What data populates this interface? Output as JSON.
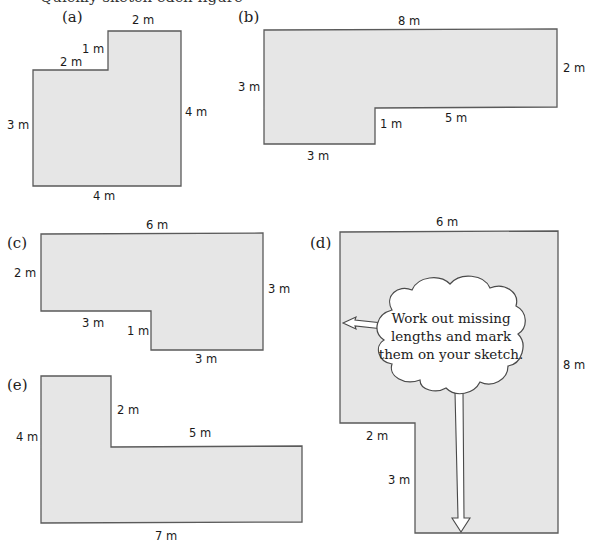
{
  "header": {
    "cut_off_text": "Quickly sketch each figure"
  },
  "colors": {
    "shape_fill": "#e6e6e6",
    "shape_stroke": "#5a5a5a",
    "cloud_fill": "#ffffff"
  },
  "shapes": [
    {
      "label": "(a)",
      "dims": [
        "2 m",
        "1 m",
        "2 m",
        "3 m",
        "4 m",
        "4 m"
      ]
    },
    {
      "label": "(b)",
      "dims": [
        "8 m",
        "3 m",
        "2 m",
        "1 m",
        "5 m",
        "3 m"
      ]
    },
    {
      "label": "(c)",
      "dims": [
        "6 m",
        "2 m",
        "3 m",
        "3 m",
        "1 m",
        "3 m"
      ]
    },
    {
      "label": "(d)",
      "dims": [
        "6 m",
        "8 m",
        "2 m",
        "3 m"
      ]
    },
    {
      "label": "(e)",
      "dims": [
        "2 m",
        "4 m",
        "5 m",
        "7 m"
      ]
    }
  ],
  "callout": {
    "lines": [
      "Work out missing",
      "lengths and mark",
      "them on your sketch."
    ]
  }
}
